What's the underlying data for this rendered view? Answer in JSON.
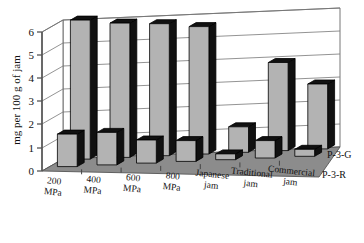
{
  "chart_data": {
    "type": "bar",
    "title": "",
    "xlabel": "",
    "ylabel": "mg per 100 g of jam",
    "ylim": [
      0,
      6
    ],
    "yticks": [
      "0",
      "1",
      "2",
      "3",
      "4",
      "5",
      "6"
    ],
    "grid": true,
    "projection": "3d",
    "legend_position": "depth-axis-right",
    "categories": [
      "200 MPa",
      "400 MPa",
      "600 MPa",
      "800 MPa",
      "Japanese jam",
      "Traditional jam",
      "Commercial jam"
    ],
    "category_lines": [
      [
        "200",
        "MPa"
      ],
      [
        "400",
        "MPa"
      ],
      [
        "600",
        "MPa"
      ],
      [
        "800",
        "MPa"
      ],
      [
        "Japanese",
        "jam"
      ],
      [
        "Traditional",
        "jam"
      ],
      [
        "Commercial",
        "jam"
      ]
    ],
    "series": [
      {
        "name": "P-3-G",
        "row": "back",
        "values": [
          6.0,
          5.8,
          5.7,
          5.5,
          1.1,
          3.8,
          2.8
        ]
      },
      {
        "name": "P-3-R",
        "row": "front",
        "values": [
          1.4,
          1.4,
          1.0,
          0.9,
          0.25,
          0.75,
          0.3
        ]
      }
    ],
    "colors": {
      "bar_face": "#b3b3b3",
      "bar_side": "#111111",
      "bar_top": "#111111",
      "floor": "#8c8c8c",
      "back_wall": "#ffffff",
      "axis": "#555555",
      "grid": "#777777"
    }
  }
}
